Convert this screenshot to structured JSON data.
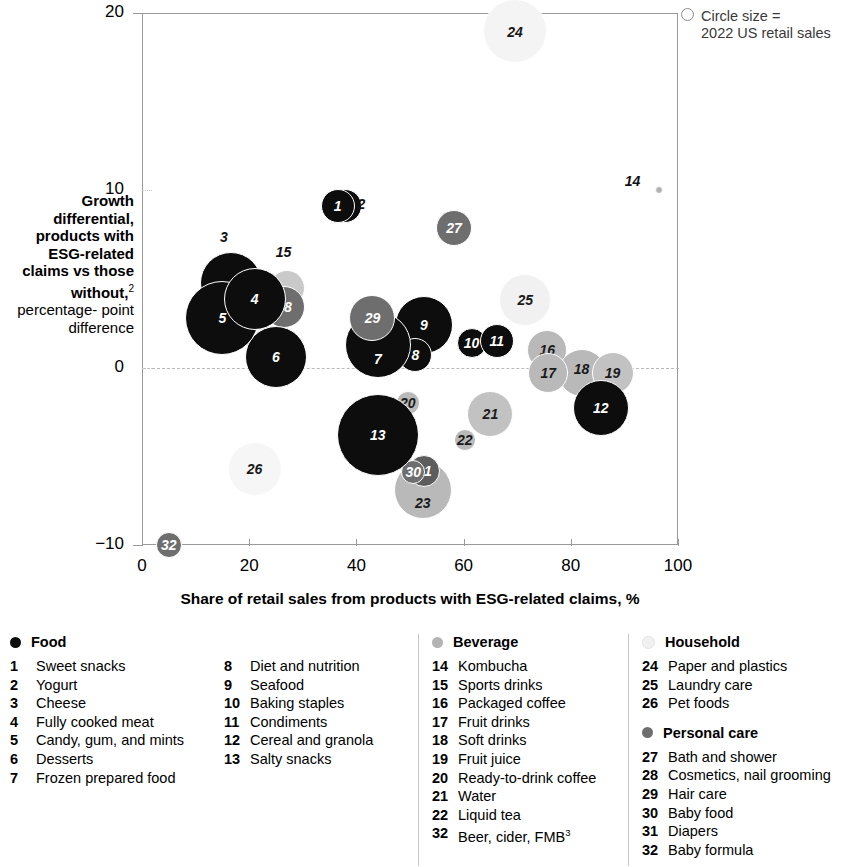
{
  "size_legend": {
    "line1": "Circle size =",
    "line2": "2022 US retail sales",
    "icon": "circle-outline-icon"
  },
  "axes": {
    "y_title_bold": "Growth differential, products with ESG-related claims vs those without,",
    "y_title_sup": "2",
    "y_title_sub1": "percentage-",
    "y_title_sub2": "point difference",
    "x_title": "Share of retail sales from products with ESG-related claims, %",
    "y_ticks": [
      "20",
      "10",
      "0",
      "−10"
    ],
    "x_ticks": [
      "0",
      "20",
      "40",
      "60",
      "80",
      "100"
    ]
  },
  "colors": {
    "food": "#0d0d0d",
    "beverage": "#b3b3b3",
    "household": "#f1f1f1",
    "personal_care": "#6e6e6e",
    "frame": "#9a9a9a",
    "zero_line": "#b9b9b9"
  },
  "legend": {
    "groups": [
      {
        "title": "Food",
        "dot": "#0d0d0d",
        "dot_name": "legend-dot-food",
        "items_left": [
          {
            "num": "1",
            "name": "Sweet snacks"
          },
          {
            "num": "2",
            "name": "Yogurt"
          },
          {
            "num": "3",
            "name": "Cheese"
          },
          {
            "num": "4",
            "name": "Fully cooked meat"
          },
          {
            "num": "5",
            "name": "Candy, gum, and mints"
          },
          {
            "num": "6",
            "name": "Desserts"
          },
          {
            "num": "7",
            "name": "Frozen prepared food"
          }
        ],
        "items_right": [
          {
            "num": "8",
            "name": "Diet and nutrition"
          },
          {
            "num": "9",
            "name": "Seafood"
          },
          {
            "num": "10",
            "name": "Baking staples"
          },
          {
            "num": "11",
            "name": "Condiments"
          },
          {
            "num": "12",
            "name": "Cereal and granola"
          },
          {
            "num": "13",
            "name": "Salty snacks"
          }
        ]
      },
      {
        "title": "Beverage",
        "dot": "#b3b3b3",
        "dot_name": "legend-dot-beverage",
        "items_left": [
          {
            "num": "14",
            "name": "Kombucha"
          },
          {
            "num": "15",
            "name": "Sports drinks"
          },
          {
            "num": "16",
            "name": "Packaged coffee"
          },
          {
            "num": "17",
            "name": "Fruit drinks"
          },
          {
            "num": "18",
            "name": "Soft drinks"
          },
          {
            "num": "19",
            "name": "Fruit juice"
          },
          {
            "num": "20",
            "name": "Ready-to-drink coffee"
          },
          {
            "num": "21",
            "name": "Water"
          },
          {
            "num": "22",
            "name": "Liquid tea"
          },
          {
            "num": "32",
            "name": "Beer, cider, FMB",
            "sup": "3"
          }
        ],
        "items_right": []
      },
      {
        "title": "Household",
        "dot": "#f1f1f1",
        "dot_name": "legend-dot-household",
        "items_left": [
          {
            "num": "24",
            "name": "Paper and plastics"
          },
          {
            "num": "25",
            "name": "Laundry care"
          },
          {
            "num": "26",
            "name": "Pet foods"
          }
        ],
        "items_right": []
      },
      {
        "title": "Personal care",
        "dot": "#6e6e6e",
        "dot_name": "legend-dot-personal-care",
        "items_left": [
          {
            "num": "27",
            "name": "Bath and shower"
          },
          {
            "num": "28",
            "name": "Cosmetics, nail grooming"
          },
          {
            "num": "29",
            "name": "Hair care"
          },
          {
            "num": "30",
            "name": "Baby food"
          },
          {
            "num": "31",
            "name": "Diapers"
          },
          {
            "num": "32",
            "name": "Baby formula"
          }
        ],
        "items_right": []
      }
    ]
  },
  "chart_data": {
    "type": "scatter",
    "title": "",
    "xlabel": "Share of retail sales from products with ESG-related claims, %",
    "ylabel": "Growth differential, products with ESG-related claims vs those without, percentage-point difference",
    "xlim": [
      0,
      100
    ],
    "ylim": [
      -10,
      20
    ],
    "grid": false,
    "legend_position": "bottom",
    "bubble_meaning": "Circle size = 2022 US retail sales",
    "points": [
      {
        "id": "1",
        "label": "Sweet snacks",
        "group": "Food",
        "x": 36.5,
        "y": 9.1,
        "r": 17,
        "color": "#0d0d0d",
        "label_inside": true,
        "z": 30
      },
      {
        "id": "2",
        "label": "Yogurt",
        "group": "Food",
        "x": 37.8,
        "y": 9.1,
        "r": 17,
        "color": "#0d0d0d",
        "label_inside": false,
        "label_dx": 20,
        "label_dy": -2,
        "z": 29
      },
      {
        "id": "3",
        "label": "Cheese",
        "group": "Food",
        "x": 16.6,
        "y": 4.8,
        "r": 31,
        "color": "#0d0d0d",
        "label_inside": false,
        "label_dx": -4,
        "label_dy": -46,
        "z": 25
      },
      {
        "id": "4",
        "label": "Fully cooked meat",
        "group": "Food",
        "x": 21.0,
        "y": 3.9,
        "r": 31,
        "color": "#0d0d0d",
        "label_inside": true,
        "z": 28
      },
      {
        "id": "5",
        "label": "Candy, gum, and mints",
        "group": "Food",
        "x": 15.0,
        "y": 2.8,
        "r": 37,
        "color": "#0d0d0d",
        "label_inside": true,
        "z": 27
      },
      {
        "id": "6",
        "label": "Desserts",
        "group": "Food",
        "x": 25.0,
        "y": 0.6,
        "r": 31,
        "color": "#0d0d0d",
        "label_inside": true,
        "z": 26
      },
      {
        "id": "7",
        "label": "Frozen prepared food",
        "group": "Food",
        "x": 44.0,
        "y": 1.3,
        "r": 33,
        "color": "#0d0d0d",
        "label_inside": true,
        "label_dy": 14,
        "z": 24
      },
      {
        "id": "8",
        "label": "Diet and nutrition",
        "group": "Food",
        "x": 51.0,
        "y": 0.7,
        "r": 17,
        "color": "#0d0d0d",
        "label_inside": true,
        "z": 23
      },
      {
        "id": "9",
        "label": "Seafood",
        "group": "Food",
        "x": 52.6,
        "y": 2.4,
        "r": 29,
        "color": "#0d0d0d",
        "label_inside": true,
        "z": 22
      },
      {
        "id": "10",
        "label": "Baking staples",
        "group": "Food",
        "x": 61.5,
        "y": 1.4,
        "r": 15,
        "color": "#0d0d0d",
        "label_inside": true,
        "z": 21
      },
      {
        "id": "11",
        "label": "Condiments",
        "group": "Food",
        "x": 66.2,
        "y": 1.5,
        "r": 17,
        "color": "#0d0d0d",
        "label_inside": true,
        "z": 21
      },
      {
        "id": "12",
        "label": "Cereal and granola",
        "group": "Food",
        "x": 85.6,
        "y": -2.3,
        "r": 28,
        "color": "#0d0d0d",
        "label_inside": true,
        "z": 21
      },
      {
        "id": "13",
        "label": "Salty snacks",
        "group": "Food",
        "x": 44.0,
        "y": -3.8,
        "r": 41,
        "color": "#0d0d0d",
        "label_inside": true,
        "z": 20
      },
      {
        "id": "14",
        "label": "Kombucha",
        "group": "Beverage",
        "x": 96.4,
        "y": 10.0,
        "r": 4,
        "color": "#b3b3b3",
        "label_inside": false,
        "label_dx": -27,
        "label_dy": -9,
        "z": 10
      },
      {
        "id": "15",
        "label": "Sports drinks",
        "group": "Beverage",
        "x": 27.0,
        "y": 4.5,
        "r": 18,
        "color": "#c9c9c9",
        "label_inside": false,
        "label_dx": -4,
        "label_dy": -36,
        "z": 12
      },
      {
        "id": "16",
        "label": "Packaged coffee",
        "group": "Beverage",
        "x": 75.6,
        "y": 1.0,
        "r": 20,
        "color": "#b9b9b9",
        "label_inside": true,
        "z": 13
      },
      {
        "id": "17",
        "label": "Fruit drinks",
        "group": "Beverage",
        "x": 75.8,
        "y": -0.3,
        "r": 20,
        "color": "#b9b9b9",
        "label_inside": true,
        "z": 14
      },
      {
        "id": "18",
        "label": "Soft drinks",
        "group": "Beverage",
        "x": 82.0,
        "y": -0.3,
        "r": 24,
        "color": "#b9b9b9",
        "label_inside": true,
        "label_dy": -4,
        "z": 13
      },
      {
        "id": "19",
        "label": "Fruit juice",
        "group": "Beverage",
        "x": 87.8,
        "y": -0.3,
        "r": 21,
        "color": "#c2c2c2",
        "label_inside": true,
        "z": 14
      },
      {
        "id": "20",
        "label": "Ready-to-drink coffee",
        "group": "Beverage",
        "x": 49.6,
        "y": -2.0,
        "r": 12,
        "color": "#b9b9b9",
        "label_inside": true,
        "z": 15
      },
      {
        "id": "21",
        "label": "Water",
        "group": "Beverage",
        "x": 65.0,
        "y": -2.6,
        "r": 23,
        "color": "#c2c2c2",
        "label_inside": true,
        "z": 12
      },
      {
        "id": "22",
        "label": "Liquid tea",
        "group": "Beverage",
        "x": 60.2,
        "y": -4.1,
        "r": 11,
        "color": "#b9b9b9",
        "label_inside": true,
        "z": 12
      },
      {
        "id": "23",
        "label": "",
        "group": "Beverage",
        "x": 52.4,
        "y": -6.9,
        "r": 29,
        "color": "#b9b9b9",
        "label_inside": true,
        "label_dy": 13,
        "z": 11
      },
      {
        "id": "24",
        "label": "Paper and plastics",
        "group": "Household",
        "x": 69.6,
        "y": 19.0,
        "r": 32,
        "color": "#f4f4f4",
        "label_inside": true,
        "label_dy": 1,
        "z": 5
      },
      {
        "id": "25",
        "label": "Laundry care",
        "group": "Household",
        "x": 71.5,
        "y": 3.8,
        "r": 26,
        "color": "#f1f1f1",
        "label_inside": true,
        "z": 6
      },
      {
        "id": "26",
        "label": "Pet foods",
        "group": "Household",
        "x": 21.0,
        "y": -5.7,
        "r": 27,
        "color": "#f6f6f6",
        "label_inside": true,
        "z": 5
      },
      {
        "id": "27",
        "label": "Bath and shower",
        "group": "Personal care",
        "x": 58.2,
        "y": 7.9,
        "r": 18,
        "color": "#6e6e6e",
        "label_inside": true,
        "z": 16
      },
      {
        "id": "28",
        "label": "Cosmetics, nail grooming",
        "group": "Personal care",
        "x": 26.5,
        "y": 3.4,
        "r": 21,
        "color": "#6e6e6e",
        "label_inside": true,
        "z": 17
      },
      {
        "id": "29",
        "label": "Hair care",
        "group": "Personal care",
        "x": 43.0,
        "y": 2.8,
        "r": 23,
        "color": "#6e6e6e",
        "label_inside": true,
        "z": 25
      },
      {
        "id": "30",
        "label": "Baby food",
        "group": "Personal care",
        "x": 50.6,
        "y": -5.9,
        "r": 12,
        "color": "#6e6e6e",
        "label_inside": true,
        "z": 19
      },
      {
        "id": "31",
        "label": "Diapers",
        "group": "Personal care",
        "x": 52.6,
        "y": -5.8,
        "r": 16,
        "color": "#5d5d5d",
        "label_inside": true,
        "z": 18
      },
      {
        "id": "32",
        "label": "Baby formula",
        "group": "Personal care",
        "x": 5.0,
        "y": -10.0,
        "r": 13,
        "color": "#6e6e6e",
        "label_inside": true,
        "z": 20
      }
    ]
  }
}
